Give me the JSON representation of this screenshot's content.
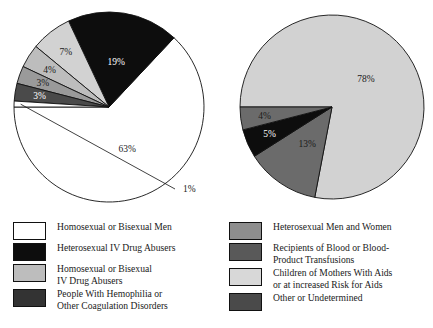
{
  "figure": {
    "background_color": "#ffffff",
    "outline_color": "#111111"
  },
  "palette": {
    "white": "#ffffff",
    "black": "#0d0d0d",
    "light_gray": "#d2d2d2",
    "mid_light_gray": "#bdbdbd",
    "mid_gray": "#9a9a9a",
    "dark_gray": "#6b6b6b",
    "darker_gray": "#4a4a4a",
    "very_dark_gray": "#333333"
  },
  "charts": [
    {
      "id": "left-pie",
      "type": "pie",
      "title": "",
      "center": {
        "x": 109,
        "y": 107
      },
      "radius": 95,
      "start_angle_deg": 180,
      "direction": "counterclockwise-from-9-oclock",
      "slices": [
        {
          "label": "Homosexual or Bisexual Men",
          "value": 63,
          "display": "63%",
          "color": "#ffffff",
          "label_on_dark": false
        },
        {
          "label": "Heterosexual IV Drug Abusers",
          "value": 19,
          "display": "19%",
          "color": "#0d0d0d",
          "label_on_dark": true
        },
        {
          "label": "Homosexual or Bisexual IV Drug Abusers",
          "value": 7,
          "display": "7%",
          "color": "#d2d2d2",
          "label_on_dark": false
        },
        {
          "label": "People With Hemophilia or Other Coagulation Disorders",
          "value": 4,
          "display": "4%",
          "color": "#bdbdbd",
          "label_on_dark": false
        },
        {
          "label": "Heterosexual Men and Women",
          "value": 3,
          "display": "3%",
          "color": "#9a9a9a",
          "label_on_dark": false
        },
        {
          "label": "Recipients of Blood or Blood-Product Transfusions",
          "value": 3,
          "display": "3%",
          "color": "#4a4a4a",
          "label_on_dark": true
        },
        {
          "label": "Other or Undetermined",
          "value": 1,
          "display": "1%",
          "color": "#ffffff",
          "label_on_dark": false
        }
      ],
      "callout": {
        "display": "1%",
        "x": 183,
        "y": 192
      }
    },
    {
      "id": "right-pie",
      "type": "pie",
      "title": "",
      "center": {
        "x": 332,
        "y": 107
      },
      "radius": 92,
      "start_angle_deg": 180,
      "direction": "clockwise-from-9-oclock",
      "slices": [
        {
          "label": "Children of Mothers With Aids or at increased Risk for Aids",
          "value": 78,
          "display": "78%",
          "color": "#d2d2d2",
          "label_on_dark": false
        },
        {
          "label": "Recipients of Blood or Blood-Product Transfusions",
          "value": 13,
          "display": "13%",
          "color": "#6b6b6b",
          "label_on_dark": false
        },
        {
          "label": "Heterosexual IV Drug Abusers",
          "value": 5,
          "display": "5%",
          "color": "#0d0d0d",
          "label_on_dark": true
        },
        {
          "label": "Heterosexual Men and Women",
          "value": 4,
          "display": "4%",
          "color": "#6b6b6b",
          "label_on_dark": false
        }
      ]
    }
  ],
  "chart_data": [
    {
      "type": "pie",
      "title": "",
      "categories": [
        "Homosexual or Bisexual Men",
        "Heterosexual IV Drug Abusers",
        "Homosexual or Bisexual IV Drug Abusers",
        "People With Hemophilia or Other Coagulation Disorders",
        "Heterosexual Men and Women",
        "Recipients of Blood or Blood-Product Transfusions",
        "Other or Undetermined"
      ],
      "values": [
        63,
        19,
        7,
        4,
        3,
        3,
        1
      ],
      "value_labels": [
        "63%",
        "19%",
        "7%",
        "4%",
        "3%",
        "3%",
        "1%"
      ],
      "unit": "percent",
      "legend_position": "below-left"
    },
    {
      "type": "pie",
      "title": "",
      "categories": [
        "Children of Mothers With Aids or at increased Risk for Aids",
        "Recipients of Blood or Blood-Product Transfusions",
        "Heterosexual IV Drug Abusers",
        "Heterosexual Men and Women"
      ],
      "values": [
        78,
        13,
        5,
        4
      ],
      "value_labels": [
        "78%",
        "13%",
        "5%",
        "4%"
      ],
      "unit": "percent",
      "legend_position": "below-right"
    }
  ],
  "legend_left": {
    "items": [
      {
        "color": "#ffffff",
        "label": "Homosexual or Bisexual Men"
      },
      {
        "color": "#0d0d0d",
        "label": "Heterosexual IV Drug Abusers"
      },
      {
        "color": "#bdbdbd",
        "label": "Homosexual or Bisexual\nIV Drug Abusers"
      },
      {
        "color": "#333333",
        "label": "People With Hemophilia or\nOther Coagulation Disorders"
      }
    ]
  },
  "legend_right": {
    "items": [
      {
        "color": "#8e8e8e",
        "label": "Heterosexual Men and Women"
      },
      {
        "color": "#595959",
        "label": "Recipients of Blood or Blood-\nProduct Transfusions"
      },
      {
        "color": "#d8d8d8",
        "label": "Children of Mothers With Aids\nor at increased Risk for Aids"
      },
      {
        "color": "#4a4a4a",
        "label": "Other or Undetermined"
      }
    ]
  }
}
